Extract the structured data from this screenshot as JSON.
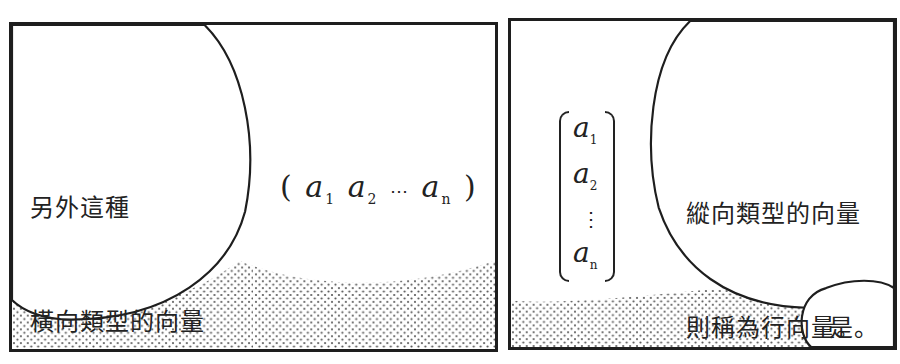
{
  "panels": [
    {
      "id": "panel-1",
      "speech_bubble": {
        "lines": [
          "另外這種",
          "橫向類型的向量",
          "稱為列向量。"
        ]
      },
      "math": {
        "type": "row-vector",
        "open": "(",
        "entries": [
          {
            "base": "a",
            "sub": "1"
          },
          {
            "base": "a",
            "sub": "2"
          },
          {
            "base": "⋯",
            "sub": ""
          },
          {
            "base": "a",
            "sub": "n"
          }
        ],
        "close": ")"
      }
    },
    {
      "id": "panel-2",
      "speech_bubble": {
        "lines": [
          "縱向類型的向量",
          "則稱為行向量。"
        ]
      },
      "small_bubble": {
        "text": "是。"
      },
      "math": {
        "type": "column-vector",
        "entries": [
          {
            "base": "a",
            "sub": "1"
          },
          {
            "base": "a",
            "sub": "2"
          },
          {
            "base": "⋮",
            "sub": ""
          },
          {
            "base": "a",
            "sub": "n"
          }
        ]
      }
    }
  ],
  "colors": {
    "ink": "#1e1e1e",
    "paper": "#ffffff",
    "screentone": "#555555"
  }
}
